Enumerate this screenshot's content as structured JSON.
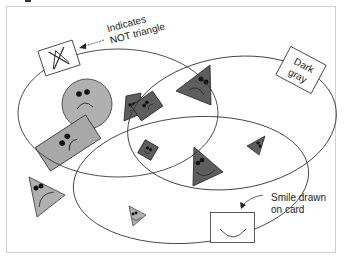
{
  "figure": {
    "width": 345,
    "height": 259,
    "frame_color": "#c8c8c8"
  },
  "colors": {
    "light_gray": "#b4b4b4",
    "mid_gray": "#9a9a9a",
    "dark_gray": "#5e5e5e",
    "outline": "#333333",
    "ellipse_stroke": "#3a3a3a"
  },
  "annotations": {
    "not_triangle_line1": "Indicates",
    "not_triangle_line2": "NOT triangle",
    "dark_gray_line1": "Dark",
    "dark_gray_line2": "gray",
    "smile_line1": "Smile drawn",
    "smile_line2": "on card"
  },
  "sets": [
    {
      "name": "left-set",
      "cx": 118,
      "cy": 113,
      "rx": 100,
      "ry": 64
    },
    {
      "name": "right-set",
      "cx": 232,
      "cy": 123,
      "rx": 105,
      "ry": 66
    },
    {
      "name": "bottom-set",
      "cx": 191,
      "cy": 180,
      "rx": 118,
      "ry": 62
    }
  ],
  "cards": [
    {
      "shape": "circle",
      "color": "light_gray",
      "mood": "sad"
    },
    {
      "shape": "rectangle",
      "color": "light_gray",
      "mood": "sad"
    },
    {
      "shape": "parallelogram",
      "color": "dark_gray",
      "mood": "sad"
    },
    {
      "shape": "rectangle",
      "color": "dark_gray",
      "mood": "sad"
    },
    {
      "shape": "triangle",
      "color": "dark_gray",
      "mood": "sad"
    },
    {
      "shape": "square",
      "color": "dark_gray",
      "mood": "happy"
    },
    {
      "shape": "triangle",
      "color": "dark_gray",
      "mood": "happy"
    },
    {
      "shape": "triangle",
      "color": "dark_gray",
      "mood": "sad"
    },
    {
      "shape": "triangle",
      "color": "light_gray",
      "mood": "sad"
    },
    {
      "shape": "triangle",
      "color": "light_gray",
      "mood": "happy"
    }
  ]
}
